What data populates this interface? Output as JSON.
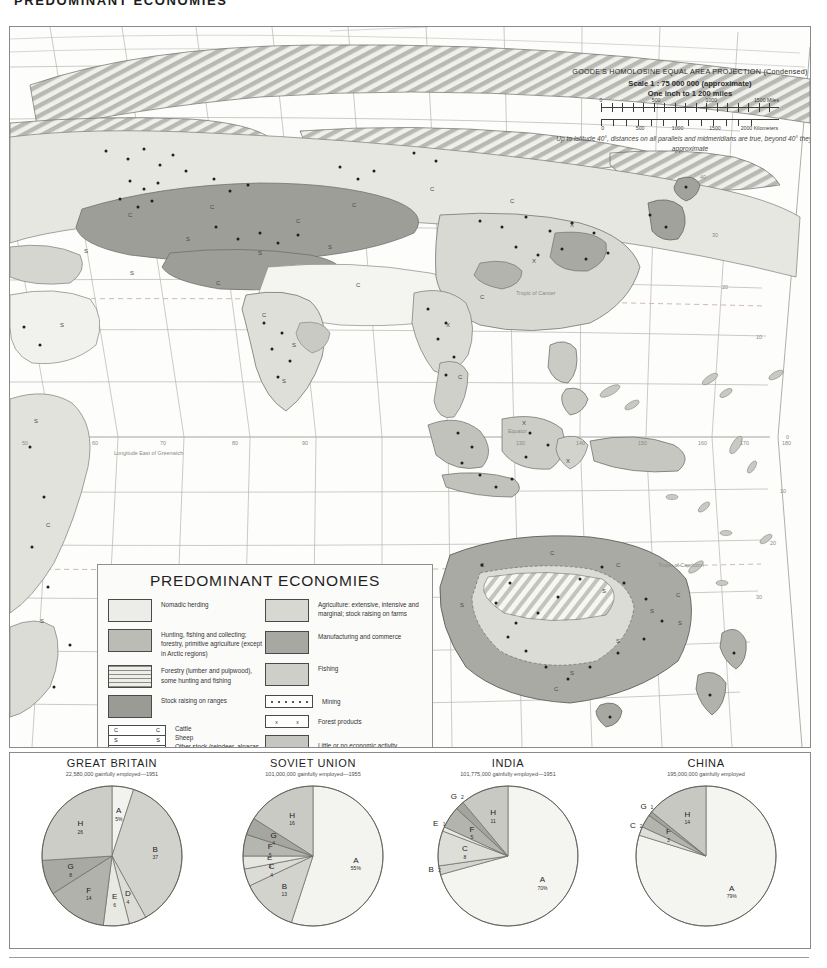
{
  "page_title": "PREDOMINANT ECONOMIES",
  "projection": {
    "name": "GOODE'S HOMOLOSINE EQUAL AREA PROJECTION  (Condensed)",
    "scale": "Scale 1 : 75 000 000 (approximate)",
    "inch_scale": "One inch to 1 200 miles",
    "miles_ticks": [
      "0",
      "500",
      "1000",
      "1500 Miles"
    ],
    "km_ticks": [
      "0",
      "500",
      "1000",
      "1500",
      "2000 Kilometers"
    ],
    "note": "Up to latitude 40°, distances on all parallels and midmeridians are true, beyond 40° they are approximate"
  },
  "map_labels": {
    "longitude_caption": "Longitude East of Greenwich",
    "equator": "Equator",
    "tropic_cancer": "Tropic of Cancer",
    "tropic_capricorn": "Tropic of Capricorn",
    "latitudes_right": [
      "40",
      "30",
      "20",
      "10",
      "0",
      "10",
      "20",
      "30"
    ],
    "longitudes_bottom": [
      "50",
      "60",
      "70",
      "80",
      "90",
      "130",
      "140",
      "150",
      "160",
      "170",
      "180"
    ],
    "stock_letters": [
      "C",
      "S",
      "X"
    ]
  },
  "legend": {
    "title": "PREDOMINANT ECONOMIES",
    "left_items": [
      {
        "label": "Nomadic herding",
        "pattern": "solid",
        "color": "#ecece8"
      },
      {
        "label": "Hunting, fishing and collecting; forestry, primitive agriculture (except in Arctic regions)",
        "pattern": "solid",
        "color": "#bcbcb6"
      },
      {
        "label": "Forestry (lumber and pulpwood), some hunting and fishing",
        "pattern": "hlines",
        "color": "#e4e4df"
      },
      {
        "label": "Stock raising on ranges",
        "pattern": "solid",
        "color": "#9b9b95"
      }
    ],
    "right_items": [
      {
        "label": "Agriculture: extensive, intensive and marginal; stock raising on farms",
        "pattern": "solid",
        "color": "#d8d8d2"
      },
      {
        "label": "Manufacturing and commerce",
        "pattern": "solid",
        "color": "#a8a8a2"
      },
      {
        "label": "Fishing",
        "pattern": "solid",
        "color": "#cfcfc9"
      },
      {
        "label": "Mining",
        "pattern": "dots",
        "color": "#ffffff"
      },
      {
        "label": "Forest products",
        "pattern": "xmark",
        "color": "#ffffff"
      },
      {
        "label": "Little or no economic activity",
        "pattern": "solid",
        "color": "#c6c6c0"
      }
    ],
    "stock_table": [
      {
        "sym": "C",
        "label": "Cattle"
      },
      {
        "sym": "S",
        "label": "Sheep"
      },
      {
        "sym": "V",
        "label": "Other stock (reindeer, alpacas, llamas)"
      }
    ]
  },
  "chart_data": [
    {
      "type": "pie",
      "title": "GREAT BRITAIN",
      "subtitle": "22,580,000 gainfully employed—1951",
      "categories": [
        "A",
        "B",
        "D",
        "E",
        "F",
        "G",
        "H"
      ],
      "values": [
        5,
        37,
        4,
        6,
        14,
        8,
        26
      ],
      "labels": [
        "A 5%",
        "B 37",
        "D 4",
        "E 6",
        "F 14",
        "G 8",
        "H 26"
      ],
      "colors": [
        "#f2f2ee",
        "#d2d2cc",
        "#dddcd6",
        "#e9e9e4",
        "#b2b2ac",
        "#a9a9a3",
        "#cdcdc7"
      ]
    },
    {
      "type": "pie",
      "title": "SOVIET UNION",
      "subtitle": "101,000,000 gainfully employed—1955",
      "categories": [
        "A",
        "B",
        "C",
        "E",
        "F",
        "G",
        "H"
      ],
      "values": [
        55,
        13,
        4,
        3,
        5,
        4,
        16
      ],
      "labels": [
        "A 55%",
        "B 13",
        "C 4",
        "E 3",
        "F 5",
        "G 4",
        "H 16"
      ],
      "colors": [
        "#f3f3ef",
        "#d3d3cd",
        "#dcdcd6",
        "#e7e7e2",
        "#b6b6b0",
        "#a6a6a0",
        "#cacac4"
      ]
    },
    {
      "type": "pie",
      "title": "INDIA",
      "subtitle": "101,775,000 gainfully employed—1951",
      "categories": [
        "A",
        "B",
        "C",
        "E",
        "F",
        "G",
        "H"
      ],
      "values": [
        70,
        2,
        8,
        1,
        5,
        2,
        11
      ],
      "labels": [
        "A 70%",
        "B 2",
        "C 8",
        "E 1",
        "F 5",
        "G 2",
        "H 11"
      ],
      "colors": [
        "#f4f4f0",
        "#d5d5cf",
        "#deded8",
        "#e8e8e3",
        "#b4b4ae",
        "#a4a49e",
        "#c9c9c3"
      ]
    },
    {
      "type": "pie",
      "title": "CHINA",
      "subtitle": "195,000,000 gainfully employed",
      "categories": [
        "A",
        "C",
        "F",
        "G",
        "H"
      ],
      "values": [
        79,
        2,
        3,
        1,
        14
      ],
      "labels": [
        "A 79%",
        "C 2",
        "F 3",
        "G 1",
        "H 14"
      ],
      "colors": [
        "#f4f4f0",
        "#deded8",
        "#b4b4ae",
        "#a4a49e",
        "#c8c8c2"
      ]
    }
  ]
}
